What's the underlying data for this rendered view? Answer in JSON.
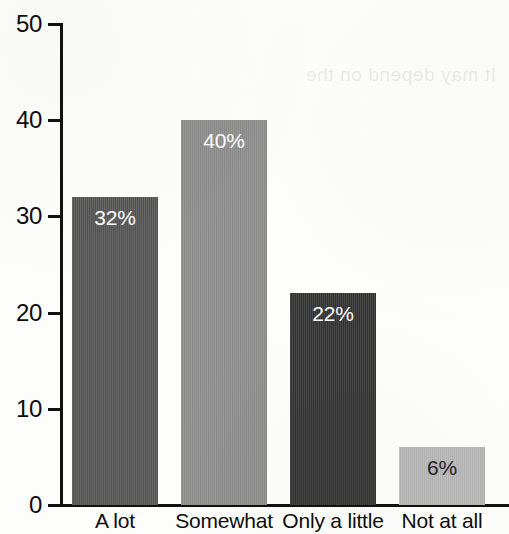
{
  "chart_data": {
    "type": "bar",
    "title": "",
    "xlabel": "",
    "ylabel": "",
    "categories": [
      "A lot",
      "Somewhat",
      "Only a little",
      "Not at all"
    ],
    "values": [
      32,
      40,
      22,
      6
    ],
    "data_labels": [
      "32%",
      "40%",
      "22%",
      "6%"
    ],
    "bar_colors": [
      "#565656",
      "#8e8e8e",
      "#333333",
      "#b8b8b8"
    ],
    "data_label_colors": [
      "#ffffff",
      "#ffffff",
      "#ffffff",
      "#232323"
    ],
    "ylim": [
      0,
      50
    ],
    "yticks": [
      0,
      10,
      20,
      30,
      40,
      50
    ],
    "ytick_labels": [
      "0",
      "10",
      "20",
      "30",
      "40",
      "50"
    ],
    "grid": false,
    "legend": false,
    "axis_color": "#111111",
    "background_color": "#fdfdfb"
  },
  "artifacts": {
    "bleed_through_text": "It may depend on the"
  }
}
